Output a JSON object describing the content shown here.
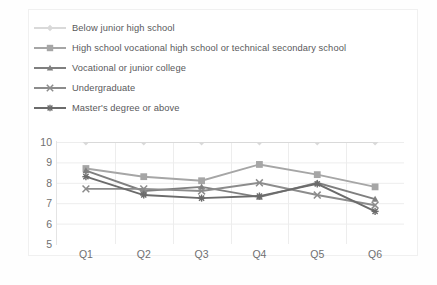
{
  "chart_data": {
    "type": "line",
    "title": "",
    "subtitle": "",
    "xlabel": "",
    "ylabel": "",
    "categories": [
      "Q1",
      "Q2",
      "Q3",
      "Q4",
      "Q5",
      "Q6"
    ],
    "ylim": [
      5,
      10
    ],
    "yticks": [
      5,
      6,
      7,
      8,
      9,
      10
    ],
    "grid": true,
    "legend_position": "top-left",
    "series": [
      {
        "name": "Below junior high school",
        "marker": "diamond",
        "color": "#d9d9d9",
        "values": [
          10.0,
          10.0,
          10.0,
          10.0,
          10.0,
          10.0
        ]
      },
      {
        "name": "High school vocational high school or technical secondary school",
        "marker": "square",
        "color": "#a6a6a6",
        "values": [
          8.7,
          8.3,
          8.1,
          8.9,
          8.4,
          7.8
        ]
      },
      {
        "name": "Vocational or junior college",
        "marker": "triangle",
        "color": "#7f7f7f",
        "values": [
          8.6,
          7.6,
          7.8,
          7.3,
          8.0,
          7.2
        ]
      },
      {
        "name": "Undergraduate",
        "marker": "x",
        "color": "#8c8c8c",
        "values": [
          7.7,
          7.7,
          7.6,
          8.0,
          7.4,
          6.9
        ]
      },
      {
        "name": "Master's degree or above",
        "marker": "asterisk",
        "color": "#6b6b6b",
        "values": [
          8.3,
          7.4,
          7.25,
          7.35,
          7.95,
          6.6
        ]
      }
    ]
  },
  "axis": {
    "y_labels": [
      "10",
      "9",
      "8",
      "7",
      "6",
      "5"
    ],
    "x_labels": [
      "Q1",
      "Q2",
      "Q3",
      "Q4",
      "Q5",
      "Q6"
    ]
  },
  "legend": {
    "items": [
      {
        "label": "Below junior high school",
        "marker": "diamond-marker-icon",
        "color": "#d9d9d9"
      },
      {
        "label": "High school vocational high school or technical secondary school",
        "marker": "square-marker-icon",
        "color": "#a6a6a6"
      },
      {
        "label": "Vocational or junior college",
        "marker": "triangle-marker-icon",
        "color": "#7f7f7f"
      },
      {
        "label": "Undergraduate",
        "marker": "x-marker-icon",
        "color": "#8c8c8c"
      },
      {
        "label": "Master's degree or above",
        "marker": "asterisk-marker-icon",
        "color": "#6b6b6b"
      }
    ]
  },
  "style": {
    "grid_color": "#ededed",
    "axis_text_color": "#6f6f71",
    "legend_text_color": "#59595b",
    "plot_background": "#ffffff",
    "frame_border": "#f0f0f0"
  }
}
